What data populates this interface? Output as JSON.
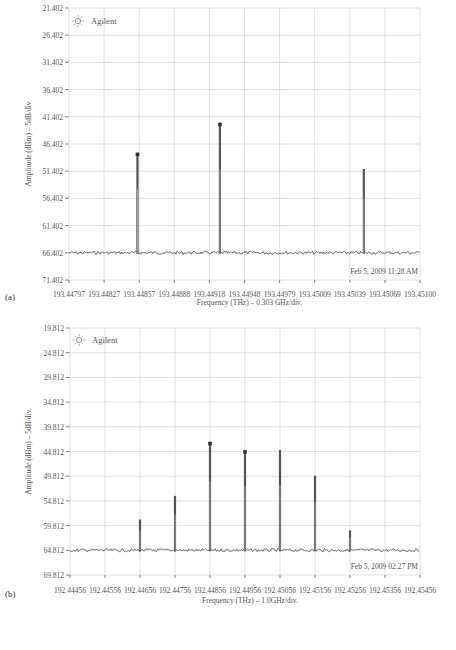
{
  "chart_data": [
    {
      "panel_label": "(a)",
      "type": "line",
      "brand": "Agilent",
      "timestamp": "Feb 5, 2009 11:28 AM",
      "xlabel": "Frequency (THz) – 0.303 GHz/div.",
      "ylabel": "Amplitude (dBm) – 5dB/div",
      "y_ticks": [
        "21.402",
        "26.402",
        "31.402",
        "36.402",
        "41.402",
        "46.402",
        "51.402",
        "56.402",
        "61.402",
        "66.402",
        "71.402"
      ],
      "x_ticks": [
        "193.44797",
        "193.44827",
        "193.44857",
        "193.44888",
        "193.44918",
        "193.44948",
        "193.44979",
        "193.45009",
        "193.45039",
        "193.45069",
        "193.45100"
      ],
      "ylim_top": 21.402,
      "ylim_bottom": 71.402,
      "noise_floor": 66.4,
      "grid": true,
      "peaks": [
        {
          "x_frac": 0.195,
          "level": 48.3,
          "marker": true
        },
        {
          "x_frac": 0.43,
          "level": 42.8,
          "marker": true
        },
        {
          "x_frac": 0.84,
          "level": 51.0,
          "marker": false
        }
      ]
    },
    {
      "panel_label": "(b)",
      "type": "line",
      "brand": "Agilent",
      "timestamp": "Feb 5, 2009 02:27 PM",
      "xlabel": "Frequency (THz) – 1.0GHz/div.",
      "ylabel": "Amplitude (dBm) – 5dB/div.",
      "y_ticks": [
        "19.812",
        "24.812",
        "29.812",
        "34.812",
        "39.812",
        "44.812",
        "49.812",
        "54.812",
        "59.812",
        "64.812",
        "69.812"
      ],
      "x_ticks": [
        "192.44456",
        "192.44556",
        "192.44656",
        "192.44756",
        "192.44856",
        "192.44956",
        "192.45056",
        "192.45156",
        "192.45256",
        "192.45356",
        "192.45456"
      ],
      "ylim_top": 19.812,
      "ylim_bottom": 69.812,
      "noise_floor": 64.8,
      "grid": true,
      "peaks": [
        {
          "x_frac": 0.2,
          "level": 58.6,
          "marker": false
        },
        {
          "x_frac": 0.3,
          "level": 53.8,
          "marker": false
        },
        {
          "x_frac": 0.4,
          "level": 43.2,
          "marker": true
        },
        {
          "x_frac": 0.5,
          "level": 44.9,
          "marker": true
        },
        {
          "x_frac": 0.6,
          "level": 44.5,
          "marker": false
        },
        {
          "x_frac": 0.7,
          "level": 49.7,
          "marker": false
        },
        {
          "x_frac": 0.8,
          "level": 60.8,
          "marker": false
        }
      ]
    }
  ]
}
